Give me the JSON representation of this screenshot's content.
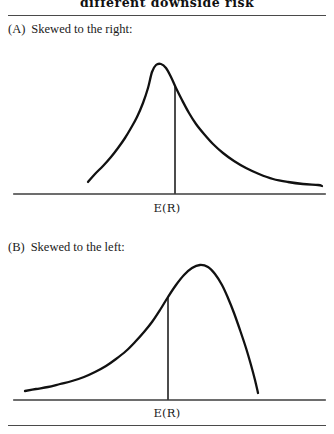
{
  "figure": {
    "title": "different downside risk",
    "title_truncated_top": true
  },
  "panels": [
    {
      "tag": "(A)",
      "caption": "Skewed to the right:",
      "axis_label": "E(R)"
    },
    {
      "tag": "(B)",
      "caption": "Skewed to the left:",
      "axis_label": "E(R)"
    }
  ],
  "chart_data": [
    {
      "type": "line",
      "title": "(A) Skewed to the right:",
      "xlabel": "E(R)",
      "ylabel": "",
      "grid": false,
      "legend": null,
      "annotations": [
        {
          "text": "E(R)",
          "x": 175,
          "kind": "vertical-mean-line"
        }
      ],
      "curve": {
        "name": "right-skewed probability density",
        "skew": "positive",
        "peak_x": 152,
        "mean_line_x": 175,
        "x_start": 88,
        "x_end": 322,
        "points": [
          [
            88,
            182
          ],
          [
            95,
            174
          ],
          [
            103,
            166
          ],
          [
            111,
            157
          ],
          [
            118,
            148
          ],
          [
            125,
            138
          ],
          [
            131,
            128
          ],
          [
            137,
            117
          ],
          [
            143,
            103
          ],
          [
            148,
            88
          ],
          [
            152,
            72
          ],
          [
            156,
            65
          ],
          [
            161,
            64
          ],
          [
            166,
            68
          ],
          [
            171,
            77
          ],
          [
            176,
            88
          ],
          [
            182,
            100
          ],
          [
            189,
            113
          ],
          [
            196,
            124
          ],
          [
            204,
            134
          ],
          [
            213,
            144
          ],
          [
            223,
            153
          ],
          [
            234,
            161
          ],
          [
            246,
            168
          ],
          [
            259,
            174
          ],
          [
            273,
            179
          ],
          [
            288,
            182
          ],
          [
            303,
            184
          ],
          [
            318,
            185
          ],
          [
            322,
            186
          ]
        ]
      },
      "axis": {
        "y": 194,
        "x_start": 14,
        "x_end": 325
      }
    },
    {
      "type": "line",
      "title": "(B) Skewed to the left:",
      "xlabel": "E(R)",
      "ylabel": "",
      "grid": false,
      "legend": null,
      "annotations": [
        {
          "text": "E(R)",
          "x": 168,
          "kind": "vertical-mean-line"
        }
      ],
      "curve": {
        "name": "left-skewed probability density",
        "skew": "negative",
        "peak_x": 200,
        "mean_line_x": 168,
        "x_start": 25,
        "x_end": 258,
        "points": [
          [
            25,
            391
          ],
          [
            36,
            389
          ],
          [
            48,
            387
          ],
          [
            60,
            384
          ],
          [
            72,
            381
          ],
          [
            84,
            377
          ],
          [
            95,
            372
          ],
          [
            106,
            366
          ],
          [
            116,
            359
          ],
          [
            126,
            351
          ],
          [
            135,
            342
          ],
          [
            144,
            332
          ],
          [
            152,
            322
          ],
          [
            160,
            310
          ],
          [
            168,
            297
          ],
          [
            176,
            285
          ],
          [
            184,
            275
          ],
          [
            192,
            268
          ],
          [
            200,
            265
          ],
          [
            208,
            267
          ],
          [
            215,
            274
          ],
          [
            222,
            285
          ],
          [
            228,
            298
          ],
          [
            234,
            313
          ],
          [
            240,
            330
          ],
          [
            246,
            348
          ],
          [
            251,
            365
          ],
          [
            255,
            380
          ],
          [
            258,
            393
          ]
        ]
      },
      "axis": {
        "y": 400,
        "x_start": 14,
        "x_end": 325
      }
    }
  ]
}
